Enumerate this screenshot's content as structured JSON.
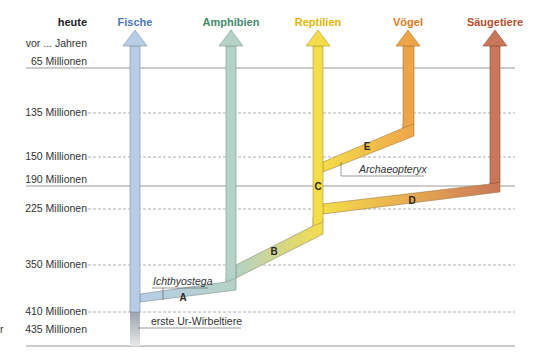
{
  "header": {
    "time_label": "heute",
    "unit_label": "vor ... Jahren"
  },
  "time_axis": [
    {
      "label": "65 Millionen",
      "y": 68,
      "line": "solid"
    },
    {
      "label": "135 Millionen",
      "y": 113,
      "line": "dashed"
    },
    {
      "label": "150 Millionen",
      "y": 157,
      "line": "dashed"
    },
    {
      "label": "190 Millionen",
      "y": 186,
      "line": "solid"
    },
    {
      "label": "225 Millionen",
      "y": 209,
      "line": "dashed"
    },
    {
      "label": "350 Millionen",
      "y": 265,
      "line": "dashed"
    },
    {
      "label": "410 Millionen",
      "y": 312,
      "line": "dashed"
    },
    {
      "label": "435 Millionen",
      "y": 330,
      "line": "none"
    }
  ],
  "classes": [
    {
      "name": "Fische",
      "color": "#4a78b8",
      "fill": "#b7cde6"
    },
    {
      "name": "Amphibien",
      "color": "#3f8a6a",
      "fill": "#b4d2c6"
    },
    {
      "name": "Reptilien",
      "color": "#e0b400",
      "fill": "#f5dc4a"
    },
    {
      "name": "Vögel",
      "color": "#e07a1e",
      "fill": "#eea54a"
    },
    {
      "name": "Säugetiere",
      "color": "#b5502a",
      "fill": "#c8775a"
    }
  ],
  "branches": {
    "A": "A",
    "B": "B",
    "C": "C",
    "D": "D",
    "E": "E"
  },
  "annotations": {
    "ichthyostega": "Ichthyostega",
    "archaeopteryx": "Archaeopteryx",
    "first_vertebrates": "erste Ur-Wirbeltiere"
  },
  "margin_fragment": "r"
}
